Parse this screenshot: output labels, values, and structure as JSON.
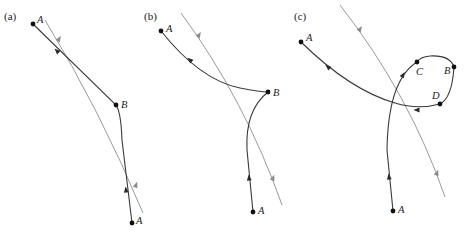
{
  "figure": {
    "panels": [
      {
        "id": "a",
        "label": "(a)",
        "label_pos": [
          4,
          20
        ],
        "reference_path": "M 45 20 Q 100 110 143 213",
        "reference_arrows": [
          [
            59,
            39,
            -58
          ],
          [
            136,
            185,
            -70
          ]
        ],
        "trail_path": "M 33 24 L 116 105 Q 121 112 122 140 L 132 223",
        "trail_arrows": [
          [
            57,
            51,
            -135
          ],
          [
            126,
            190,
            -96
          ]
        ],
        "points": [
          {
            "name": "A",
            "x": 33,
            "y": 24,
            "lx": 37,
            "ly": 23
          },
          {
            "name": "B",
            "x": 116,
            "y": 105,
            "lx": 121,
            "ly": 108
          },
          {
            "name": "A",
            "x": 132,
            "y": 223,
            "lx": 136,
            "ly": 224
          }
        ]
      },
      {
        "id": "b",
        "label": "(b)",
        "label_pos": [
          144,
          20
        ],
        "reference_path": "M 181 13 Q 245 100 282 205",
        "reference_arrows": [
          [
            199,
            35,
            -58
          ],
          [
            273,
            178,
            -70
          ]
        ],
        "trail_path": "M 161 31 Q 200 80 240 88 Q 260 92 268 92 Q 245 110 247 150 L 253 212",
        "trail_arrows": [
          [
            190,
            60,
            -140
          ],
          [
            249,
            178,
            -96
          ]
        ],
        "points": [
          {
            "name": "A",
            "x": 161,
            "y": 31,
            "lx": 166,
            "ly": 32
          },
          {
            "name": "B",
            "x": 268,
            "y": 92,
            "lx": 273,
            "ly": 96
          },
          {
            "name": "A",
            "x": 253,
            "y": 212,
            "lx": 258,
            "ly": 214
          }
        ]
      },
      {
        "id": "c",
        "label": "(c)",
        "label_pos": [
          294,
          20
        ],
        "reference_path": "M 340 5 Q 410 95 445 197",
        "reference_arrows": [
          [
            360,
            29,
            -58
          ],
          [
            437,
            173,
            -70
          ]
        ],
        "trail_path": "M 301 42 Q 350 90 395 103 Q 418 110 440 104 Q 452 98 454 67 Q 450 55 430 56 Q 420 57 417 62 Q 388 80 387 150 L 393 211",
        "trail_arrows": [
          [
            328,
            67,
            -140
          ],
          [
            417,
            110,
            180
          ],
          [
            403,
            75,
            -60
          ],
          [
            389,
            177,
            -96
          ]
        ],
        "points": [
          {
            "name": "A",
            "x": 301,
            "y": 42,
            "lx": 306,
            "ly": 41
          },
          {
            "name": "C",
            "x": 417,
            "y": 62,
            "lx": 416,
            "ly": 75
          },
          {
            "name": "B",
            "x": 454,
            "y": 67,
            "lx": 444,
            "ly": 74
          },
          {
            "name": "D",
            "x": 440,
            "y": 104,
            "lx": 432,
            "ly": 99
          },
          {
            "name": "A",
            "x": 393,
            "y": 211,
            "lx": 398,
            "ly": 213
          }
        ]
      }
    ],
    "colors": {
      "trail": "#3a3a3a",
      "reference": "#9a9a9a",
      "point": "#111111"
    }
  }
}
